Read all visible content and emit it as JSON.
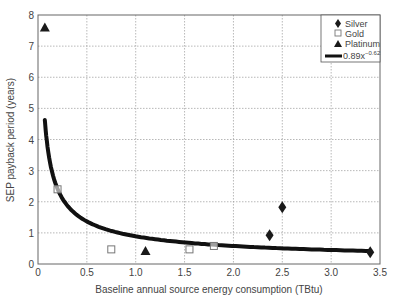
{
  "chart_data": {
    "type": "scatter",
    "title": "",
    "xlabel": "Baseline annual source energy consumption (TBtu)",
    "ylabel": "SEP payback period (years)",
    "xlim": [
      0,
      3.5
    ],
    "ylim": [
      0,
      8
    ],
    "xticks": [
      "0",
      "0.5",
      "1.0",
      "1.5",
      "2.0",
      "2.5",
      "3.0",
      "3.5"
    ],
    "xtick_values": [
      0,
      0.5,
      1.0,
      1.5,
      2.0,
      2.5,
      3.0,
      3.5
    ],
    "yticks": [
      "0",
      "1",
      "2",
      "3",
      "4",
      "5",
      "6",
      "7",
      "8"
    ],
    "ytick_values": [
      0,
      1,
      2,
      3,
      4,
      5,
      6,
      7,
      8
    ],
    "grid": true,
    "legend_position": "upper right",
    "series": [
      {
        "name": "Silver",
        "marker": "diamond",
        "color": "#1a1a1a",
        "points": [
          [
            2.37,
            0.92
          ],
          [
            2.5,
            1.82
          ],
          [
            3.4,
            0.38
          ]
        ]
      },
      {
        "name": "Gold",
        "marker": "square-open",
        "color": "#777777",
        "points": [
          [
            0.2,
            2.4
          ],
          [
            0.75,
            0.47
          ],
          [
            1.55,
            0.47
          ],
          [
            1.8,
            0.58
          ]
        ]
      },
      {
        "name": "Platinum",
        "marker": "triangle",
        "color": "#1a1a1a",
        "points": [
          [
            0.07,
            7.6
          ],
          [
            1.1,
            0.42
          ]
        ]
      }
    ],
    "fit": {
      "name": "0.89x^-0.62",
      "label_base": "0.89x",
      "label_exp": "−0.62",
      "coef": 0.89,
      "exponent": -0.62,
      "x_range": [
        0.07,
        3.4
      ],
      "color": "#111111"
    }
  }
}
